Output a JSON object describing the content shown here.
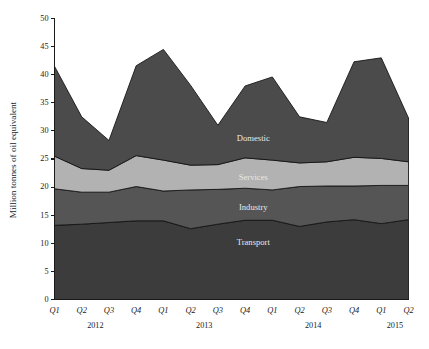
{
  "figure": {
    "background": "#ffffff"
  },
  "chart_data": {
    "type": "area",
    "title": "",
    "subtitle": "",
    "xlabel": "",
    "ylabel": "Million tonnes of oil equivalent",
    "stacked": true,
    "grid": false,
    "legend_position": "inline-labels",
    "ylim": [
      0,
      50
    ],
    "ytick_step": 5,
    "yticks": [
      0,
      5,
      10,
      15,
      20,
      25,
      30,
      35,
      40,
      45,
      50
    ],
    "ytick_labels": [
      "0",
      "5",
      "10",
      "15",
      "20",
      "25",
      "30",
      "35",
      "40",
      "45",
      "50"
    ],
    "categories": [
      "Q1",
      "Q2",
      "Q3",
      "Q4",
      "Q1",
      "Q2",
      "Q3",
      "Q4",
      "Q1",
      "Q2",
      "Q3",
      "Q4",
      "Q1",
      "Q2"
    ],
    "year_groups": [
      {
        "label": "2012",
        "start_index": 0,
        "end_index": 3
      },
      {
        "label": "2013",
        "start_index": 4,
        "end_index": 7
      },
      {
        "label": "2014",
        "start_index": 8,
        "end_index": 11
      },
      {
        "label": "2015",
        "start_index": 12,
        "end_index": 13
      }
    ],
    "series": [
      {
        "name": "Transport",
        "color": "#3c3c3c",
        "label_color": "#d8d8d8",
        "values": [
          13.2,
          13.4,
          13.7,
          14.0,
          14.0,
          12.6,
          13.4,
          14.1,
          14.1,
          13.0,
          13.8,
          14.2,
          13.5,
          14.2
        ]
      },
      {
        "name": "Industry",
        "color": "#555555",
        "label_color": "#d8d8d8",
        "values": [
          6.5,
          5.7,
          5.4,
          6.1,
          5.3,
          6.9,
          6.2,
          5.7,
          5.4,
          7.1,
          6.4,
          6.0,
          6.8,
          6.1
        ]
      },
      {
        "name": "Services",
        "color": "#b2b2b2",
        "label_color": "#7a7a7a",
        "values": [
          5.8,
          4.2,
          3.9,
          5.5,
          5.5,
          4.4,
          4.4,
          5.4,
          5.3,
          4.2,
          4.3,
          5.1,
          4.8,
          4.2
        ]
      },
      {
        "name": "Domestic",
        "color": "#4b4b4b",
        "label_color": "#dcdcdc",
        "values": [
          16.0,
          9.2,
          5.3,
          16.0,
          19.7,
          14.2,
          7.0,
          12.8,
          14.8,
          8.2,
          7.0,
          17.0,
          17.9,
          7.8
        ]
      }
    ],
    "stack_tops": [
      41.5,
      32.5,
      28.3,
      41.6,
      44.5,
      38.1,
      31.0,
      38.0,
      39.6,
      32.5,
      31.5,
      42.3,
      43.0,
      32.3
    ],
    "series_inline_labels": [
      {
        "name": "Domestic",
        "x_index": 7.3,
        "value": 28.5
      },
      {
        "name": "Services",
        "x_index": 7.3,
        "value": 21.6
      },
      {
        "name": "Industry",
        "x_index": 7.3,
        "value": 16.3
      },
      {
        "name": "Transport",
        "x_index": 7.3,
        "value": 10.0
      }
    ]
  }
}
